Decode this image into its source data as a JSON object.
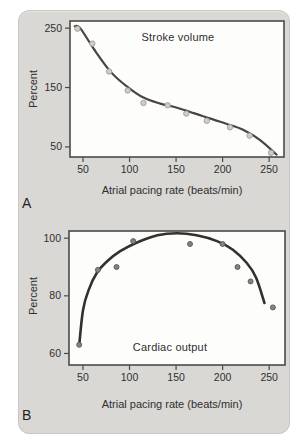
{
  "figure": {
    "panels": [
      {
        "letter": "A",
        "title": "Stroke volume",
        "xlabel": "Atrial pacing rate (beats/min)",
        "ylabel": "Percent"
      },
      {
        "letter": "B",
        "title": "Cardiac output",
        "xlabel": "Atrial pacing rate (beats/min)",
        "ylabel": "Percent"
      }
    ],
    "colors": {
      "card_background": "#d9d8d4",
      "plot_background": "#fdfdfc",
      "axis": "#4a4a48",
      "text": "#2f2f2f"
    }
  },
  "chart_data": [
    {
      "type": "scatter",
      "title": "Stroke volume",
      "xlabel": "Atrial pacing rate (beats/min)",
      "ylabel": "Percent",
      "xlim": [
        36,
        266
      ],
      "ylim": [
        33,
        262
      ],
      "xticks": [
        50,
        100,
        150,
        200,
        250
      ],
      "yticks": [
        50,
        150,
        250
      ],
      "grid": false,
      "points": [
        [
          44,
          249
        ],
        [
          60,
          224
        ],
        [
          78,
          177
        ],
        [
          98,
          145
        ],
        [
          115,
          124
        ],
        [
          141,
          120
        ],
        [
          161,
          106
        ],
        [
          183,
          94
        ],
        [
          208,
          83
        ],
        [
          229,
          69
        ],
        [
          252,
          40
        ]
      ],
      "curve": [
        [
          41,
          253
        ],
        [
          47,
          250
        ],
        [
          62,
          214
        ],
        [
          80,
          176
        ],
        [
          97,
          152
        ],
        [
          115,
          133
        ],
        [
          133,
          123
        ],
        [
          151,
          116
        ],
        [
          169,
          107
        ],
        [
          186,
          98
        ],
        [
          204,
          89
        ],
        [
          222,
          79
        ],
        [
          240,
          62
        ],
        [
          258,
          37
        ]
      ],
      "line_color": "#4b4441",
      "line_width": 2.2,
      "point_fill": "#cfcec6",
      "point_stroke": "#9e9d93",
      "point_radius": 2.7
    },
    {
      "type": "scatter",
      "title": "Cardiac output",
      "xlabel": "Atrial pacing rate (beats/min)",
      "ylabel": "Percent",
      "xlim": [
        35,
        267
      ],
      "ylim": [
        56,
        102.5
      ],
      "xticks": [
        50,
        100,
        150,
        200,
        250
      ],
      "yticks": [
        60,
        80,
        100
      ],
      "grid": false,
      "points": [
        [
          46,
          63
        ],
        [
          66,
          89
        ],
        [
          86,
          90
        ],
        [
          104,
          99
        ],
        [
          165,
          98
        ],
        [
          200,
          98
        ],
        [
          216,
          90
        ],
        [
          230,
          85
        ],
        [
          254,
          76
        ]
      ],
      "curve": [
        [
          46,
          63
        ],
        [
          50,
          75
        ],
        [
          56,
          82
        ],
        [
          65,
          88
        ],
        [
          76,
          92
        ],
        [
          90,
          95.5
        ],
        [
          108,
          98.5
        ],
        [
          130,
          101
        ],
        [
          151,
          101.7
        ],
        [
          172,
          101
        ],
        [
          194,
          99
        ],
        [
          211,
          96
        ],
        [
          226,
          91.4
        ],
        [
          236,
          86.3
        ],
        [
          245,
          77.5
        ]
      ],
      "line_color": "#353029",
      "line_width": 2.6,
      "point_fill": "#838387",
      "point_stroke": "#59595c",
      "point_radius": 2.5
    }
  ]
}
